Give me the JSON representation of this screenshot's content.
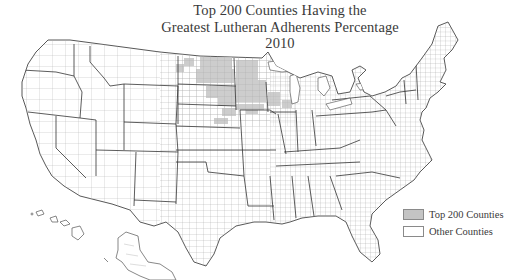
{
  "title": {
    "line1": "Top 200 Counties Having the",
    "line2": "Greatest Lutheran Adherents Percentage",
    "line3": "2010"
  },
  "legend": {
    "items": [
      {
        "label": "Top 200 Counties",
        "color": "#c4c4c4"
      },
      {
        "label": "Other Counties",
        "color": "#ffffff"
      }
    ]
  },
  "map": {
    "type": "choropleth",
    "geography": "United States counties (including Alaska and Hawaii insets)",
    "highlighted_region": "Upper Midwest / Northern Plains",
    "highlighted_states_approx": [
      "North Dakota",
      "South Dakota",
      "Minnesota",
      "Iowa",
      "Wisconsin",
      "Nebraska",
      "Montana"
    ],
    "colors": {
      "highlight": "#c4c4c4",
      "other": "#ffffff",
      "county_border": "#9a9a9a",
      "state_border": "#333333"
    }
  }
}
